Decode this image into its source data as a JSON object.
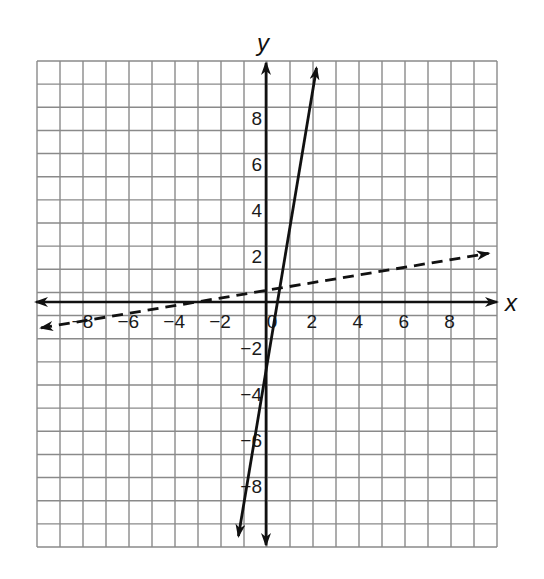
{
  "chart_data": {
    "type": "line",
    "title": "",
    "xlabel": "x",
    "ylabel": "y",
    "xlim": [
      -10,
      10
    ],
    "ylim": [
      -10.7,
      10.5
    ],
    "grid": true,
    "grid_step": 1,
    "x_ticks": [
      -8,
      -6,
      -4,
      -2,
      0,
      2,
      4,
      6,
      8
    ],
    "x_tick_labels": [
      "−8",
      "−6",
      "−4",
      "−2",
      "0",
      "2",
      "4",
      "6",
      "8"
    ],
    "y_ticks": [
      8,
      6,
      4,
      2,
      -2,
      -4,
      -6,
      -8
    ],
    "y_tick_labels": [
      "8",
      "6",
      "4",
      "2",
      "−2",
      "−4",
      "−6",
      "−8"
    ],
    "legend": null,
    "series": [
      {
        "name": "solid line",
        "style": "solid",
        "equation": "y = 6x - 3",
        "slope": 6,
        "intercept": -3,
        "x": [
          -1.2,
          2.2
        ],
        "y": [
          -10.2,
          10.2
        ],
        "arrows": "both"
      },
      {
        "name": "dashed line",
        "style": "dashed",
        "equation": "y = (1/6)x + 1/2",
        "slope": 0.1667,
        "intercept": 0.5,
        "x": [
          -9.8,
          9.7
        ],
        "y": [
          -1.13,
          2.12
        ],
        "arrows": "both"
      }
    ]
  },
  "labels": {
    "x_axis": "x",
    "y_axis": "y"
  },
  "colors": {
    "grid": "#8a8a8a",
    "axis": "#111111",
    "line": "#111111",
    "background": "#ffffff"
  }
}
